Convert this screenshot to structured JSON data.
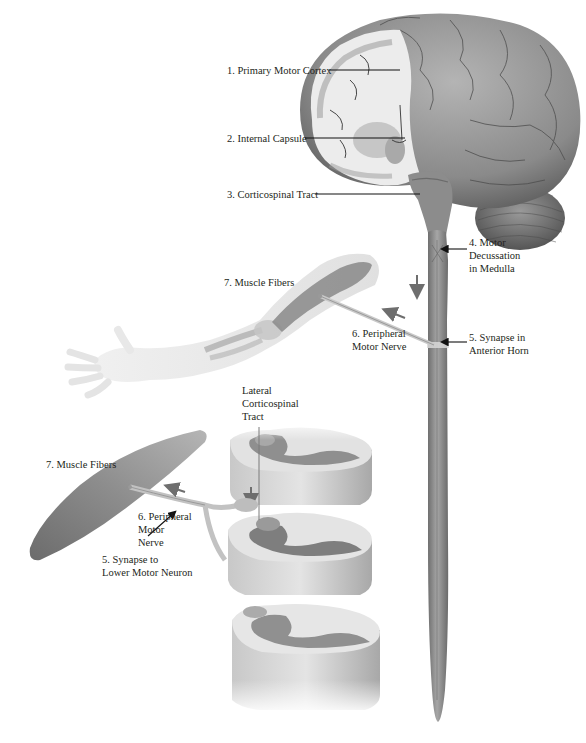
{
  "figure": {
    "colors": {
      "background": "#ffffff",
      "tissue_dark": "#7d7d7d",
      "tissue_mid": "#a9a9a9",
      "tissue_light": "#d6d6d6",
      "label_text": "#231f20",
      "arrow": "#6e6e6e"
    }
  },
  "labels": {
    "primary_motor_cortex": "1. Primary Motor Cortex",
    "internal_capsule": "2. Internal Capsule",
    "corticospinal_tract": "3. Corticospinal Tract",
    "motor_decussation": [
      "4. Motor",
      "Decussation",
      "in Medulla"
    ],
    "synapse_anterior_horn": [
      "5. Synapse in",
      "Anterior Horn"
    ],
    "peripheral_motor_nerve_arm": [
      "6. Peripheral",
      "Motor Nerve"
    ],
    "muscle_fibers_arm": "7. Muscle Fibers",
    "lateral_corticospinal_tract": [
      "Lateral",
      "Corticospinal",
      "Tract"
    ],
    "muscle_fibers_detail": "7. Muscle Fibers",
    "peripheral_motor_nerve_detail": [
      "6. Peripheral",
      "Motor",
      "Nerve"
    ],
    "synapse_lower_motor_neuron": [
      "5. Synapse to",
      "Lower Motor Neuron"
    ]
  }
}
